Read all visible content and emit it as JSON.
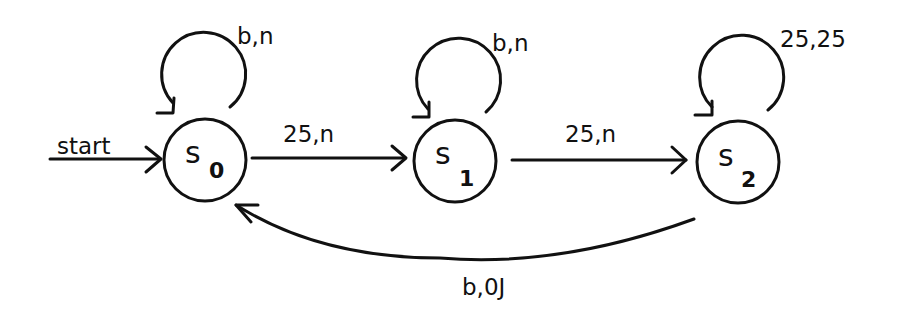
{
  "diagram": {
    "type": "finite-state-machine",
    "states": [
      {
        "id": "s0",
        "name": "s",
        "sub": "0",
        "cx": 205,
        "cy": 160,
        "r": 41,
        "initial": true
      },
      {
        "id": "s1",
        "name": "s",
        "sub": "1",
        "cx": 455,
        "cy": 161,
        "r": 41,
        "initial": false
      },
      {
        "id": "s2",
        "name": "s",
        "sub": "2",
        "cx": 738,
        "cy": 162,
        "r": 41,
        "initial": false
      }
    ],
    "start_label": "start",
    "transitions": [
      {
        "from": "s0",
        "to": "s0",
        "label": "b,n"
      },
      {
        "from": "s0",
        "to": "s1",
        "label": "25,n"
      },
      {
        "from": "s1",
        "to": "s1",
        "label": "b,n"
      },
      {
        "from": "s1",
        "to": "s2",
        "label": "25,n"
      },
      {
        "from": "s2",
        "to": "s2",
        "label": "25,25"
      },
      {
        "from": "s2",
        "to": "s0",
        "label": "b,0J"
      }
    ]
  }
}
